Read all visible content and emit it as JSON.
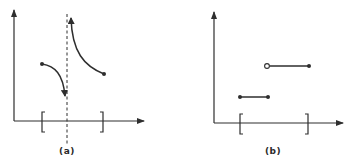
{
  "figure": {
    "ink_color": "#2e2e2e",
    "background": "#ffffff",
    "panels": [
      {
        "id": "a",
        "label": "(a)",
        "description": "Function on closed interval with a vertical asymptote inside the interval (discontinuity); left branch descends toward -infinity, right branch comes down from +infinity",
        "interval_bracket_left": "[",
        "interval_bracket_right": "]",
        "elements": {
          "y_axis": true,
          "x_axis": true,
          "vertical_asymptote": "dashed",
          "left_branch": {
            "start": "filled-dot",
            "end": "arrow-down"
          },
          "right_branch": {
            "start": "arrow-up",
            "end": "filled-dot"
          }
        }
      },
      {
        "id": "b",
        "label": "(b)",
        "description": "Step function on closed interval with jump discontinuity",
        "interval_bracket_left": "[",
        "interval_bracket_right": "]",
        "elements": {
          "y_axis": true,
          "x_axis": true,
          "lower_segment": {
            "left": "filled-dot",
            "right": "filled-dot"
          },
          "upper_segment": {
            "left": "open-circle",
            "right": "filled-dot"
          }
        }
      }
    ]
  }
}
